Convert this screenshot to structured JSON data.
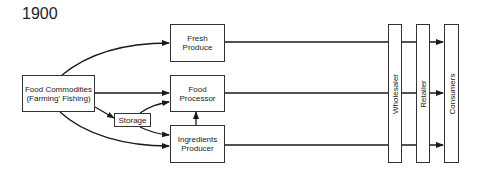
{
  "title": "1900",
  "nodes": {
    "food_commodities": {
      "line1": "Food Commodities",
      "line2": "(Farming' Fishing)"
    },
    "storage": {
      "label": "Storage"
    },
    "fresh_produce": {
      "line1": "Fresh",
      "line2": "Produce"
    },
    "food_processor": {
      "line1": "Food",
      "line2": "Processor"
    },
    "ingredients_producer": {
      "line1": "Ingredients",
      "line2": "Producer"
    },
    "wholesaler": {
      "label": "Wholesaler"
    },
    "retailer": {
      "label": "Retailer"
    },
    "consumers": {
      "label": "Consumers"
    }
  },
  "edges": [
    {
      "from": "Food Commodities",
      "to": "Fresh Produce"
    },
    {
      "from": "Food Commodities",
      "to": "Food Processor"
    },
    {
      "from": "Food Commodities",
      "to": "Storage"
    },
    {
      "from": "Food Commodities",
      "to": "Ingredients Producer"
    },
    {
      "from": "Storage",
      "to": "Food Processor"
    },
    {
      "from": "Storage",
      "to": "Ingredients Producer"
    },
    {
      "from": "Ingredients Producer",
      "to": "Food Processor"
    },
    {
      "from": "Fresh Produce",
      "to": "Consumers",
      "via": [
        "Wholesaler",
        "Retailer"
      ]
    },
    {
      "from": "Food Processor",
      "to": "Consumers",
      "via": [
        "Wholesaler",
        "Retailer"
      ]
    },
    {
      "from": "Ingredients Producer",
      "to": "Consumers",
      "via": [
        "Wholesaler",
        "Retailer"
      ]
    }
  ],
  "colors": {
    "line": "#1a1a1a",
    "box_border": "#333333",
    "background": "#ffffff"
  }
}
